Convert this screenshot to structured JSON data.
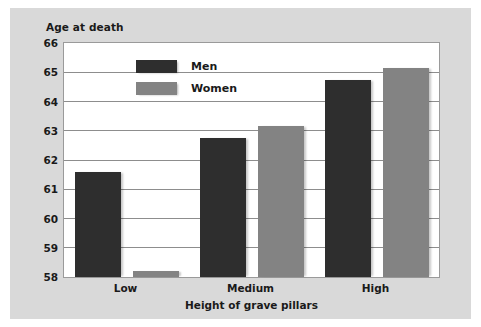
{
  "chart_data": {
    "type": "bar",
    "title": "",
    "xlabel": "Height of grave pillars",
    "ylabel": "Age at death",
    "categories": [
      "Low",
      "Medium",
      "High"
    ],
    "series": [
      {
        "name": "Men",
        "color": "#2e2e2e",
        "values": [
          61.6,
          62.75,
          64.75
        ]
      },
      {
        "name": "Women",
        "color": "#838383",
        "values": [
          58.2,
          63.15,
          65.15
        ]
      }
    ],
    "ylim": [
      58,
      66
    ],
    "yticks": [
      58,
      59,
      60,
      61,
      62,
      63,
      64,
      65,
      66
    ],
    "ytick_labels": [
      "58",
      "59",
      "60",
      "61",
      "62",
      "63",
      "64",
      "65",
      "66"
    ],
    "grid": true,
    "legend_position": "top-left-inside",
    "background_color": "#d9d9d9",
    "plot_background_color": "#ffffff",
    "gridline_color": "#8d8d8d"
  }
}
